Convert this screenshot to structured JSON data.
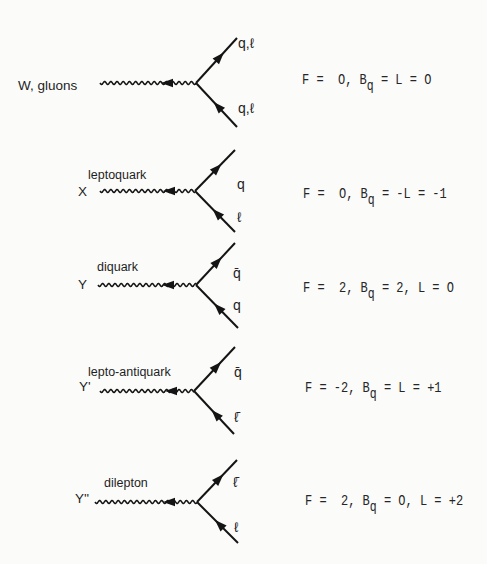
{
  "figure": {
    "diagrams": [
      {
        "boson_symbol": "W, gluons",
        "boson_type": "",
        "upper_fermion": "q,ℓ",
        "lower_fermion": "q,ℓ",
        "quantum_numbers": {
          "pre": "F =  O, B",
          "sub": "q",
          "post": " = L = O"
        }
      },
      {
        "boson_symbol": "X",
        "boson_type": "leptoquark",
        "upper_fermion": "q",
        "lower_fermion": "ℓ",
        "quantum_numbers": {
          "pre": "F =  O, B",
          "sub": "q",
          "post": " = -L = -1"
        }
      },
      {
        "boson_symbol": "Y",
        "boson_type": "diquark",
        "upper_fermion": "q̄",
        "lower_fermion": "q",
        "quantum_numbers": {
          "pre": "F =  2, B",
          "sub": "q",
          "post": " = 2, L = O"
        }
      },
      {
        "boson_symbol": "Y'",
        "boson_type": "lepto-antiquark",
        "upper_fermion": "q̄",
        "lower_fermion": "ℓ̄",
        "quantum_numbers": {
          "pre": "F = -2, B",
          "sub": "q",
          "post": " = L = +1"
        }
      },
      {
        "boson_symbol": "Y''",
        "boson_type": "dilepton",
        "upper_fermion": "ℓ̄",
        "lower_fermion": "ℓ",
        "quantum_numbers": {
          "pre": "F =  2, B",
          "sub": "q",
          "post": " = O, L = +2"
        }
      }
    ]
  }
}
